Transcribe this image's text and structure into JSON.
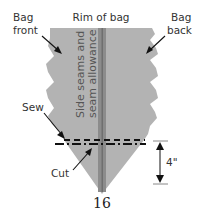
{
  "labels": {
    "bag_front_line1": "Bag",
    "bag_front_line2": "front",
    "rim": "Rim of bag",
    "bag_back_line1": "Bag",
    "bag_back_line2": "back",
    "side_seams_line1": "Side seams and",
    "side_seams_line2": "seam allowance",
    "sew": "Sew",
    "cut": "Cut",
    "measurement": "4\"",
    "figure_number": "16"
  },
  "colors": {
    "fabric": "#b3b3b3",
    "seam": "#8c8c8c",
    "seam_dark": "#6f6f6f",
    "line": "#111111",
    "dim_line": "#888888"
  }
}
